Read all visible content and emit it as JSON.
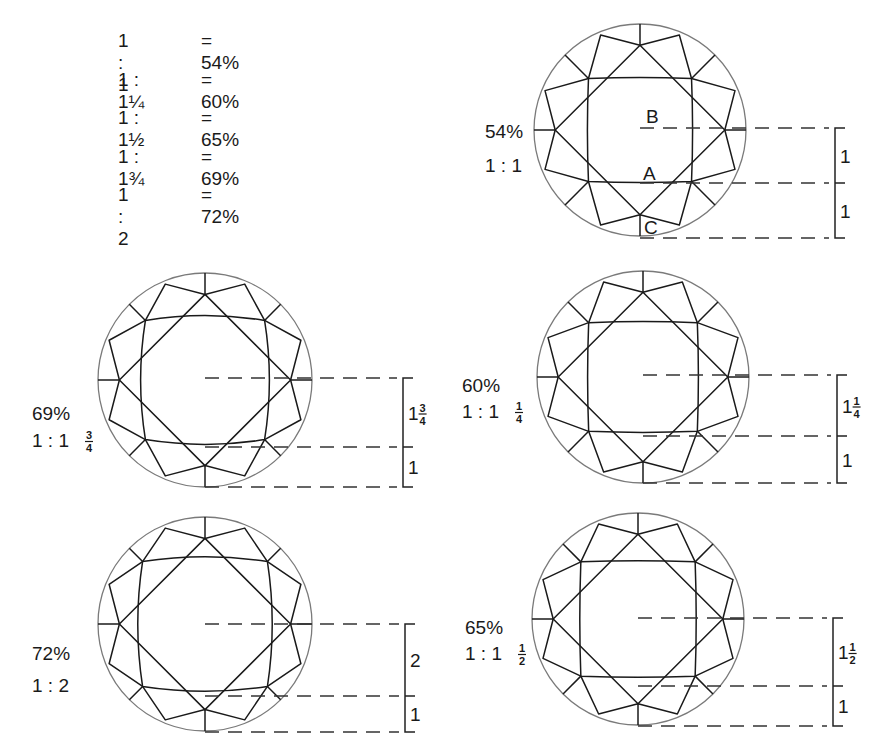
{
  "legend": {
    "rows": [
      {
        "ratio": "1 : 1",
        "percent": "= 54%"
      },
      {
        "ratio": "1 : 1¼",
        "percent": "= 60%"
      },
      {
        "ratio": "1 : 1½",
        "percent": "= 65%"
      },
      {
        "ratio": "1 : 1¾",
        "percent": "= 69%"
      },
      {
        "ratio": "1 : 2",
        "percent": "= 72%"
      }
    ]
  },
  "diagrams": [
    {
      "id": "d54",
      "percent": "54%",
      "ratio_whole": "1 : 1",
      "ratio_num": "",
      "ratio_den": "",
      "cx": 640,
      "cy": 130,
      "r": 106,
      "table_half": 0.55,
      "table_shape": "square",
      "upper_label_whole": "1",
      "upper_label_num": "",
      "upper_label_den": "",
      "lower_label": "1",
      "bracket_x": 835,
      "top_y": 128,
      "mid_y": 183,
      "bot_y": 238,
      "label_x": 485,
      "label_y1": 138,
      "label_y2": 172,
      "point_labels": [
        {
          "text": "B",
          "x": 646,
          "y": 123
        },
        {
          "text": "A",
          "x": 643,
          "y": 180
        },
        {
          "text": "C",
          "x": 644,
          "y": 234
        }
      ]
    },
    {
      "id": "d69",
      "percent": "69%",
      "ratio_whole": "1 : 1",
      "ratio_num": "3",
      "ratio_den": "4",
      "cx": 205,
      "cy": 380,
      "r": 107,
      "table_half": 0.63,
      "table_shape": "round",
      "upper_label_whole": "1",
      "upper_label_num": "3",
      "upper_label_den": "4",
      "lower_label": "1",
      "bracket_x": 403,
      "top_y": 378,
      "mid_y": 447,
      "bot_y": 487,
      "label_x": 32,
      "label_y1": 420,
      "label_y2": 447,
      "point_labels": []
    },
    {
      "id": "d60",
      "percent": "60%",
      "ratio_whole": "1 : 1",
      "ratio_num": "1",
      "ratio_den": "4",
      "cx": 643,
      "cy": 377,
      "r": 106,
      "table_half": 0.58,
      "table_shape": "square",
      "upper_label_whole": "1",
      "upper_label_num": "1",
      "upper_label_den": "4",
      "lower_label": "1",
      "bracket_x": 837,
      "top_y": 375,
      "mid_y": 436,
      "bot_y": 483,
      "label_x": 462,
      "label_y1": 392,
      "label_y2": 418,
      "point_labels": []
    },
    {
      "id": "d72",
      "percent": "72%",
      "ratio_whole": "1 : 2",
      "ratio_num": "",
      "ratio_den": "",
      "cx": 205,
      "cy": 624,
      "r": 107,
      "table_half": 0.66,
      "table_shape": "round",
      "upper_label_whole": "2",
      "upper_label_num": "",
      "upper_label_den": "",
      "lower_label": "1",
      "bracket_x": 405,
      "top_y": 624,
      "mid_y": 696,
      "bot_y": 732,
      "label_x": 32,
      "label_y1": 660,
      "label_y2": 692,
      "point_labels": []
    },
    {
      "id": "d65",
      "percent": "65%",
      "ratio_whole": "1 : 1",
      "ratio_num": "1",
      "ratio_den": "2",
      "cx": 638,
      "cy": 619,
      "r": 106,
      "table_half": 0.61,
      "table_shape": "square",
      "upper_label_whole": "1",
      "upper_label_num": "1",
      "upper_label_den": "2",
      "lower_label": "1",
      "bracket_x": 833,
      "top_y": 618,
      "mid_y": 686,
      "bot_y": 726,
      "label_x": 465,
      "label_y1": 634,
      "label_y2": 660,
      "point_labels": []
    }
  ]
}
